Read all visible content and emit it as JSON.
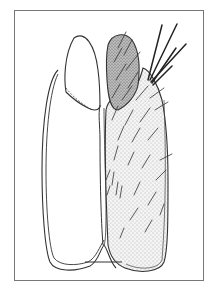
{
  "figure": {
    "type": "scientific line illustration",
    "frame_color": "#777777",
    "stroke_color": "#333333",
    "scale_bar": {
      "x1": 85,
      "x2": 122,
      "y": 262,
      "label": ""
    },
    "caption": ""
  }
}
